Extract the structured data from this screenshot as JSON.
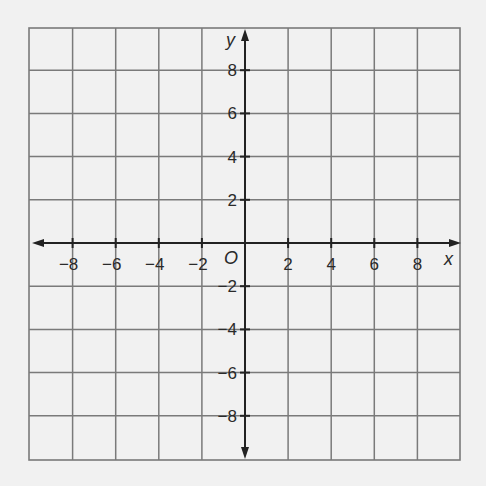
{
  "chart_data": {
    "type": "scatter",
    "title": "",
    "xlabel": "x",
    "ylabel": "y",
    "origin_label": "O",
    "xlim": [
      -10,
      10
    ],
    "ylim": [
      -10,
      10
    ],
    "grid": true,
    "grid_step": 2,
    "x_ticks": [
      -8,
      -6,
      -4,
      -2,
      2,
      4,
      6,
      8
    ],
    "y_ticks": [
      8,
      6,
      4,
      2,
      -2,
      -4,
      -6,
      -8
    ],
    "x_tick_labels": [
      "−8",
      "−6",
      "−4",
      "−2",
      "2",
      "4",
      "6",
      "8"
    ],
    "y_tick_labels": [
      "8",
      "6",
      "4",
      "2",
      "−2",
      "−4",
      "−6",
      "−8"
    ],
    "series": [],
    "legend": null
  },
  "colors": {
    "background": "#f1f1f1",
    "grid": "#7a7a7a",
    "axis": "#222222",
    "text": "#2a2a2a"
  }
}
